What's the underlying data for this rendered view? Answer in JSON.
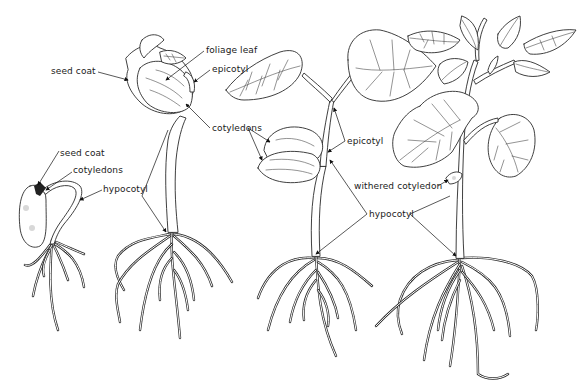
{
  "diagram": {
    "stages": [
      {
        "id": "stage-1",
        "labels": [
          {
            "key": "seed_coat",
            "text": "seed coat",
            "x": 60,
            "y": 148
          },
          {
            "key": "cotyledons",
            "text": "cotyledons",
            "x": 73,
            "y": 169
          },
          {
            "key": "hypocotyl",
            "text": "hypocotyl",
            "x": 103,
            "y": 186
          }
        ]
      },
      {
        "id": "stage-2",
        "labels": [
          {
            "key": "seed_coat",
            "text": "seed coat",
            "x": 51,
            "y": 68
          },
          {
            "key": "foliage_leaf",
            "text": "foliage leaf",
            "x": 206,
            "y": 47
          },
          {
            "key": "epicotyl",
            "text": "epicotyl",
            "x": 212,
            "y": 66
          },
          {
            "key": "cotyledons",
            "text": "cotyledons",
            "x": 212,
            "y": 124
          }
        ]
      },
      {
        "id": "stage-3",
        "labels": [
          {
            "key": "epicotyl",
            "text": "epicotyl",
            "x": 354,
            "y": 138
          }
        ]
      },
      {
        "id": "stage-4",
        "labels": [
          {
            "key": "withered_cotyledon",
            "text": "withered cotyledon",
            "x": 354,
            "y": 183
          }
        ]
      }
    ],
    "shared_labels": [
      {
        "key": "hypocotyl",
        "text": "hypocotyl",
        "x": 369,
        "y": 211
      }
    ]
  }
}
